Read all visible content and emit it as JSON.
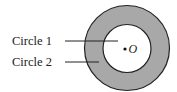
{
  "diagram": {
    "type": "concentric-circles",
    "labels": {
      "circle1": "Circle 1",
      "circle2": "Circle 2",
      "center": "O"
    },
    "colors": {
      "ring_fill": "#a8a8a8",
      "inner_fill": "#ffffff",
      "stroke": "#222222",
      "background": "#ffffff"
    },
    "geometry": {
      "center": [
        127,
        48
      ],
      "outer_radius": 43,
      "inner_radius": 24
    }
  }
}
